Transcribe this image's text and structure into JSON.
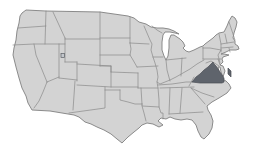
{
  "map": {
    "country": "United States",
    "description": "Map of the continental United States with one state highlighted",
    "highlighted_state": "Virginia",
    "highlighted_state_parts": [
      "Virginia mainland",
      "Virginia Eastern Shore"
    ],
    "features": {
      "great_lakes": [
        "Lake Superior",
        "Lake Michigan",
        "Lake Huron",
        "Lake Erie",
        "Lake Ontario"
      ],
      "great_salt_lake": "Great Salt Lake"
    },
    "colors": {
      "background": "#ffffff",
      "state_fill": "#d3d3d3",
      "state_border": "#8a8a8a",
      "outline": "#808080",
      "highlight_fill": "#5f646c",
      "highlight_border": "#4a4e55",
      "lake_fill": "#c3c7cc"
    },
    "aria_label": "United States map with Virginia highlighted"
  }
}
